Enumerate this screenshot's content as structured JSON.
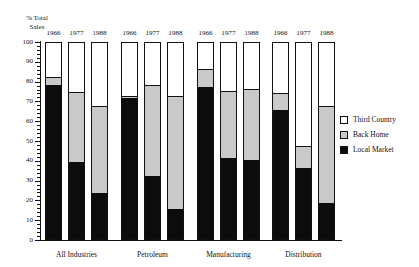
{
  "chart_data": {
    "type": "bar",
    "subtype": "stacked-bar-grouped",
    "title": "",
    "subtitle": "",
    "xlabel": "",
    "ylabel": "% Total Sales",
    "ylabel_lines": [
      "% Total",
      "Sales"
    ],
    "ylim": [
      0,
      100
    ],
    "ytick_step": 10,
    "yticks": [
      0,
      10,
      20,
      30,
      40,
      50,
      60,
      70,
      80,
      90,
      100
    ],
    "ytick_labels": [
      "0",
      "10",
      "20",
      "30",
      "40",
      "50",
      "60",
      "70",
      "80",
      "90",
      "100"
    ],
    "y_minor_step": 2,
    "grid": false,
    "stacked": true,
    "stack_total": 100,
    "legend_position": "right",
    "categories": [
      "All Industries",
      "Petroleum",
      "Manufacturing",
      "Distribution"
    ],
    "subcategories": [
      "1966",
      "1977",
      "1988"
    ],
    "series": [
      {
        "name": "Local Market",
        "color": "#0c0c0c",
        "values": [
          [
            78,
            39,
            23
          ],
          [
            71,
            32,
            15
          ],
          [
            77,
            41,
            40
          ],
          [
            65,
            36,
            18
          ]
        ]
      },
      {
        "name": "Back Home",
        "color": "#c9c9c9",
        "values": [
          [
            4,
            35,
            44
          ],
          [
            1,
            46,
            57
          ],
          [
            9,
            34,
            36
          ],
          [
            9,
            11,
            49
          ]
        ]
      },
      {
        "name": "Third Country",
        "color": "#ffffff",
        "values": [
          [
            18,
            26,
            33
          ],
          [
            28,
            22,
            28
          ],
          [
            14,
            25,
            24
          ],
          [
            26,
            53,
            33
          ]
        ]
      }
    ],
    "groups": [
      {
        "label": "All Industries",
        "bars": [
          {
            "year": "1966",
            "local_market": 78,
            "back_home": 4,
            "third_country": 18
          },
          {
            "year": "1977",
            "local_market": 39,
            "back_home": 35,
            "third_country": 26
          },
          {
            "year": "1988",
            "local_market": 23,
            "back_home": 44,
            "third_country": 33
          }
        ]
      },
      {
        "label": "Petroleum",
        "bars": [
          {
            "year": "1966",
            "local_market": 71,
            "back_home": 1,
            "third_country": 28
          },
          {
            "year": "1977",
            "local_market": 32,
            "back_home": 46,
            "third_country": 22
          },
          {
            "year": "1988",
            "local_market": 15,
            "back_home": 57,
            "third_country": 28
          }
        ]
      },
      {
        "label": "Manufacturing",
        "bars": [
          {
            "year": "1966",
            "local_market": 77,
            "back_home": 9,
            "third_country": 14
          },
          {
            "year": "1977",
            "local_market": 41,
            "back_home": 34,
            "third_country": 25
          },
          {
            "year": "1988",
            "local_market": 40,
            "back_home": 36,
            "third_country": 24
          }
        ]
      },
      {
        "label": "Distribution",
        "bars": [
          {
            "year": "1966",
            "local_market": 65,
            "back_home": 9,
            "third_country": 26
          },
          {
            "year": "1977",
            "local_market": 36,
            "back_home": 11,
            "third_country": 53
          },
          {
            "year": "1988",
            "local_market": 18,
            "back_home": 49,
            "third_country": 33
          }
        ]
      }
    ],
    "legend": [
      {
        "label": "Third Country",
        "color": "#ffffff"
      },
      {
        "label": "Back Home",
        "color": "#c9c9c9"
      },
      {
        "label": "Local Market",
        "color": "#0c0c0c"
      }
    ]
  }
}
